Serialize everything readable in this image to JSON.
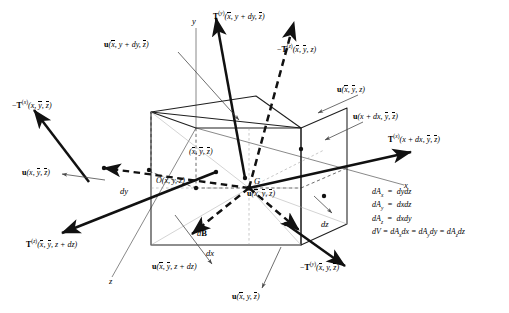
{
  "figure": {
    "type": "continuum-mechanics-stress-element"
  },
  "axes": {
    "y_label": "y",
    "x_label": "x",
    "z_label": "z"
  },
  "points": {
    "origin_label": "O(x, y, z)",
    "centroid_label": "G",
    "centroid_coords": "(x̄, ȳ, z̄)"
  },
  "dimensions": {
    "dx": "dx",
    "dy": "dy",
    "dz": "dz"
  },
  "body_force": {
    "label": "dB"
  },
  "tractions": [
    {
      "id": "t-y-plus",
      "label": "T(y)(x̄, y + dy, z̄)"
    },
    {
      "id": "t-z-minus",
      "label": "−T(z)(x̄, ȳ, z)"
    },
    {
      "id": "t-x-minus",
      "label": "−T(x)(x, ȳ, z̄)"
    },
    {
      "id": "t-x-plus",
      "label": "T(x)(x + dx, ȳ, z̄)"
    },
    {
      "id": "t-z-plus",
      "label": "T(z)(x̄, ȳ, z + dz)"
    },
    {
      "id": "t-y-minus",
      "label": "−T(y)(x̄, y, z̄)"
    }
  ],
  "displacements": [
    {
      "id": "u-y-plus",
      "label": "u(x̄, y + dy, z̄)"
    },
    {
      "id": "u-z-minus",
      "label": "u(x̄, ȳ, z)"
    },
    {
      "id": "u-x-plus",
      "label": "u(x + dx, ȳ, z̄)"
    },
    {
      "id": "u-x-minus",
      "label": "u(x, ȳ, z̄)"
    },
    {
      "id": "u-center",
      "label": "u(x̄, ȳ, z̄)"
    },
    {
      "id": "u-z-plus",
      "label": "u(x̄, ȳ, z + dz)"
    },
    {
      "id": "u-y-minus",
      "label": "u(x̄, y, z̄)"
    }
  ],
  "equations": {
    "line1": "dAx = dydz",
    "line2": "dAy = dxdz",
    "line3": "dAz = dxdy",
    "line4": "dV = dAx dx = dAy dy = dAz dz"
  },
  "colors": {
    "stroke": "#1a1a1a",
    "thin": "#555555",
    "background": "#ffffff"
  }
}
